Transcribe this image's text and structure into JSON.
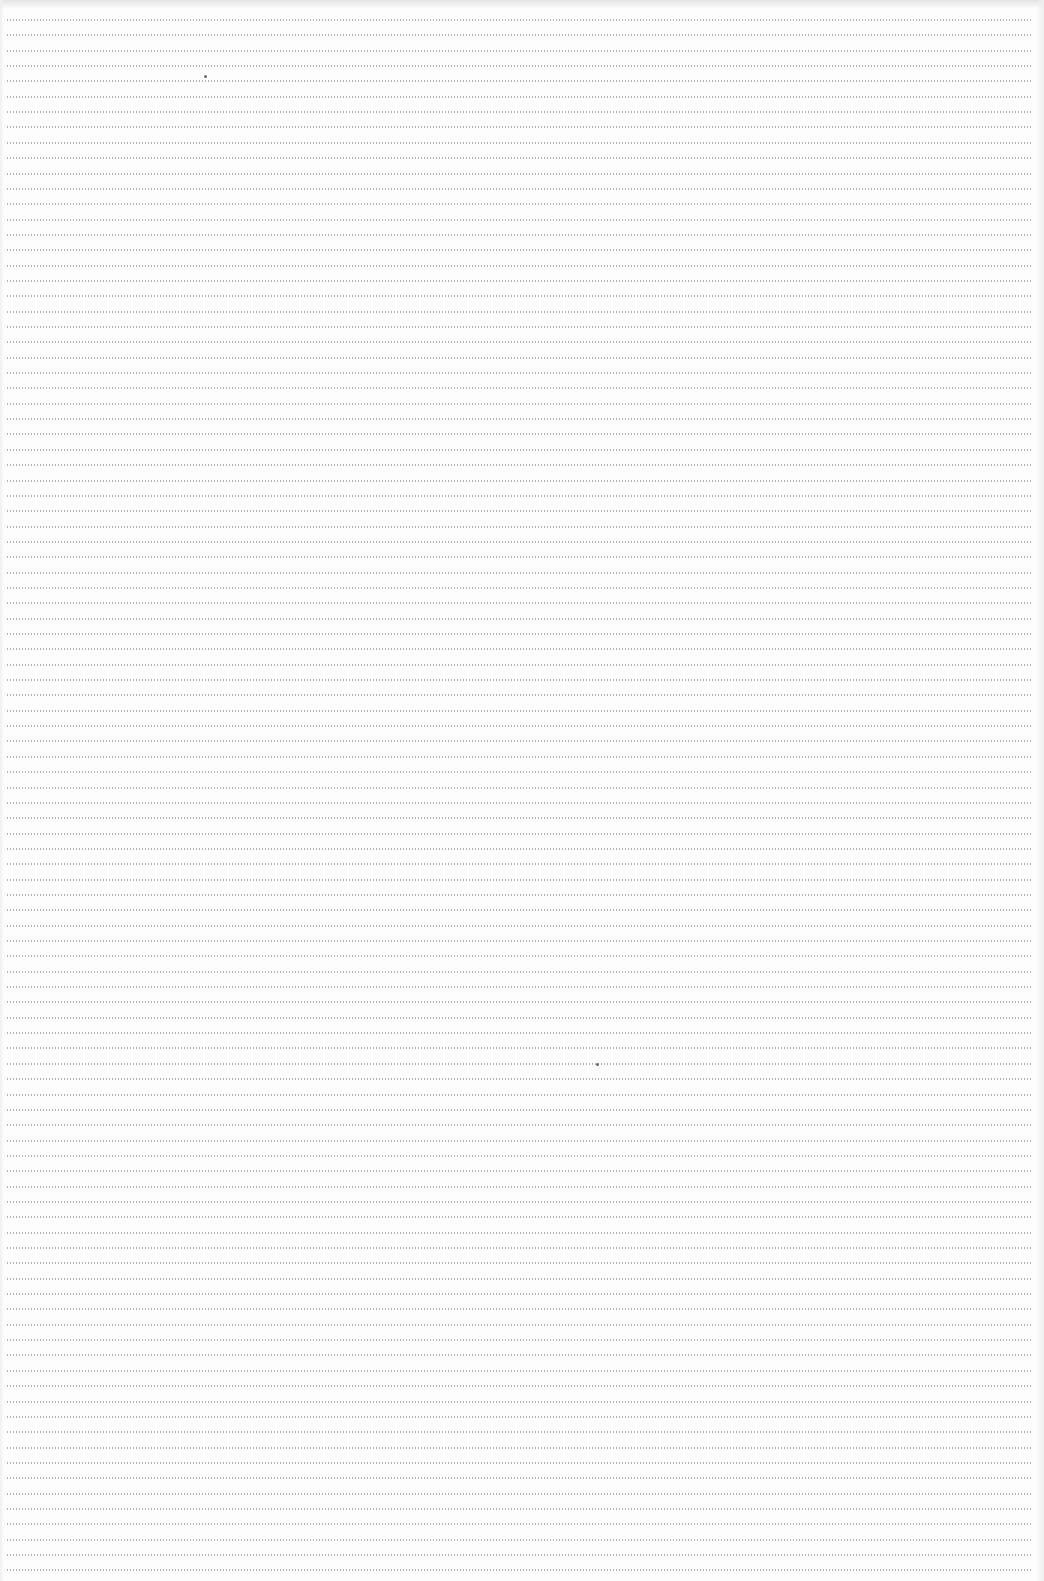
{
  "page": {
    "type": "blank dotted ruled sheet",
    "background_color": "#fdfdfd",
    "dot_color": "#9a9a9a",
    "text": ""
  },
  "ruling": {
    "first_line_y": 19,
    "line_pitch_px": 15.35,
    "line_count": 102,
    "left_margin_px": 6,
    "right_margin_px": 12,
    "style": "dotted"
  },
  "specks": [
    {
      "x": 204,
      "y": 75
    },
    {
      "x": 596,
      "y": 1063
    }
  ]
}
